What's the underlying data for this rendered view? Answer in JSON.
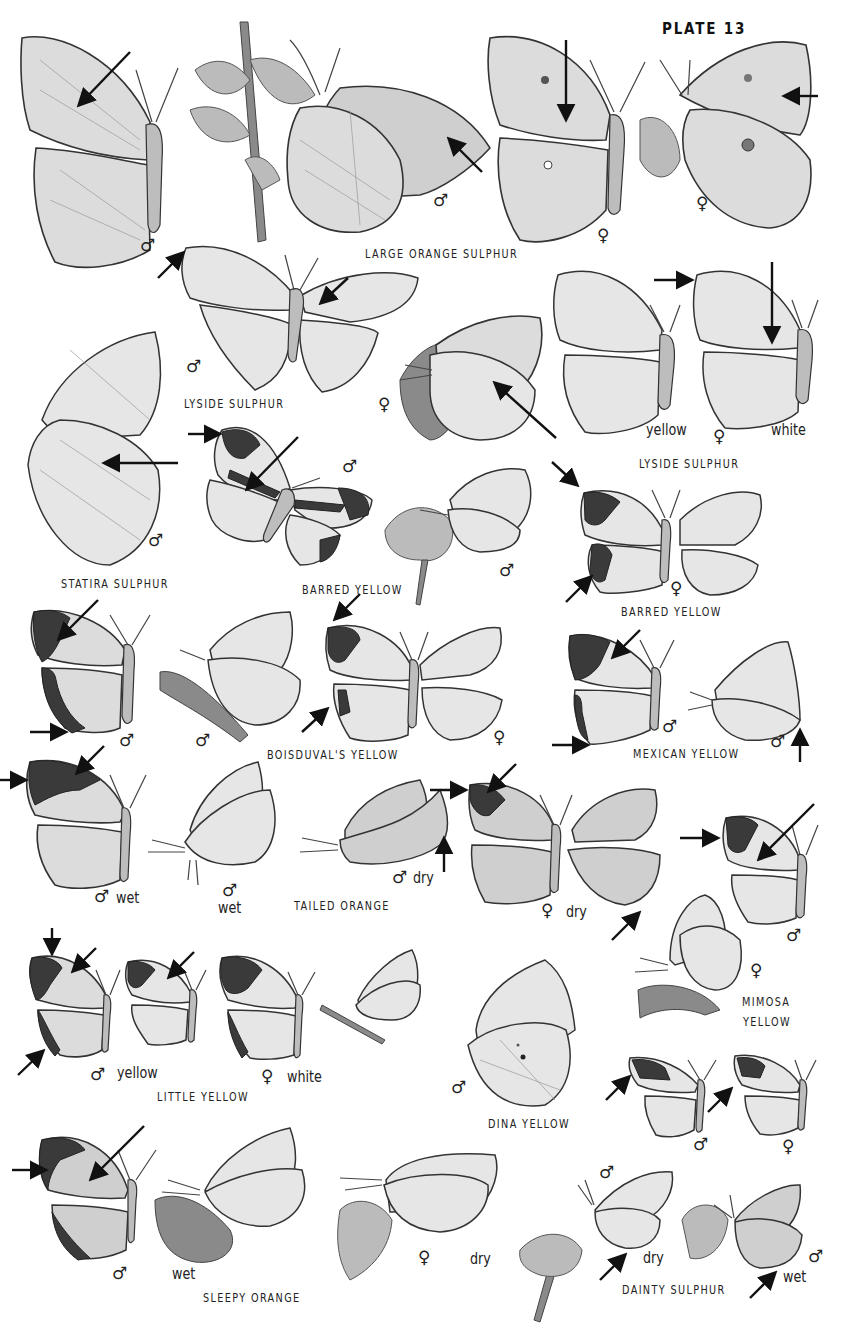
{
  "plate": {
    "title": "PLATE 13"
  },
  "species_labels": {
    "large_orange_sulphur": "LARGE ORANGE SULPHUR",
    "lyside_sulphur_male": "LYSIDE SULPHUR",
    "lyside_sulphur_female": "LYSIDE SULPHUR",
    "statira_sulphur": "STATIRA SULPHUR",
    "barred_yellow_male": "BARRED YELLOW",
    "barred_yellow_female": "BARRED YELLOW",
    "boisduvals_yellow": "BOISDUVAL'S YELLOW",
    "mexican_yellow": "MEXICAN YELLOW",
    "tailed_orange": "TAILED ORANGE",
    "mimosa_yellow_line1": "MIMOSA",
    "mimosa_yellow_line2": "YELLOW",
    "little_yellow": "LITTLE YELLOW",
    "dina_yellow": "DINA YELLOW",
    "sleepy_orange": "SLEEPY ORANGE",
    "dainty_sulphur": "DAINTY SULPHUR"
  },
  "form_labels": {
    "lyside_yellow": "yellow",
    "lyside_white": "white",
    "tailed_wet_1": "wet",
    "tailed_wet_2": "wet",
    "tailed_dry_1": "dry",
    "tailed_dry_2": "dry",
    "little_yellow": "yellow",
    "little_white": "white",
    "sleepy_wet": "wet",
    "sleepy_dry": "dry",
    "dainty_dry": "dry",
    "dainty_wet": "wet"
  },
  "symbols": {
    "male": "♂",
    "female": "♀"
  },
  "colors": {
    "background": "#ffffff",
    "ink": "#1a1a1a",
    "wing_fill": "#dcdcdc",
    "dark_border": "#3a3a3a"
  }
}
